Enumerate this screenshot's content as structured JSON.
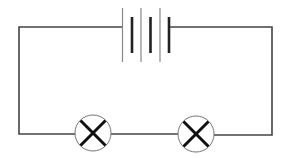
{
  "diagram": {
    "type": "circuit",
    "title": "Series circuit with battery and two lamps",
    "colors": {
      "wire": "#444444",
      "thin_plate": "#888888",
      "thick_plate": "#222222",
      "lamp_circle": "#777777",
      "lamp_cross": "#111111",
      "background": "#ffffff"
    },
    "components": [
      {
        "id": "battery",
        "kind": "battery",
        "cells": 3
      },
      {
        "id": "lamp-1",
        "kind": "lamp"
      },
      {
        "id": "lamp-2",
        "kind": "lamp"
      }
    ],
    "connections": [
      "battery-left -> lamp-1",
      "lamp-1 -> lamp-2",
      "lamp-2 -> battery-right"
    ]
  }
}
